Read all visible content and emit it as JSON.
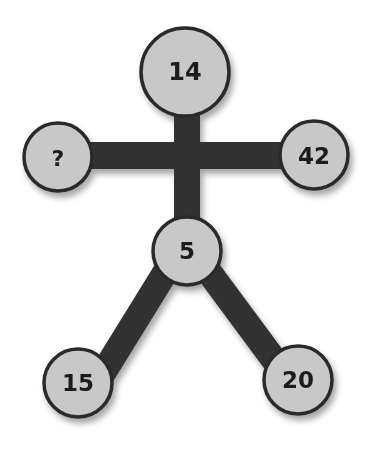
{
  "puzzle": {
    "type": "stick-figure number puzzle",
    "nodes": {
      "head": "14",
      "left_hand": "?",
      "right_hand": "42",
      "body": "5",
      "left_foot": "15",
      "right_foot": "20"
    },
    "colors": {
      "node_fill": "#c8c8c8",
      "node_stroke": "#2a2a2a",
      "limb": "#333333",
      "text": "#1e1e1e",
      "background": "#ffffff"
    }
  }
}
